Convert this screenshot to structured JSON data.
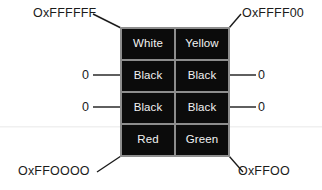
{
  "diagram": {
    "grid": {
      "columns": 2,
      "rows": 4,
      "cell_background": "#0b0b0b",
      "cell_text_color": "#f2f2f2",
      "divider_color": "#8d8d8d",
      "cells": [
        {
          "row": 1,
          "col": 1,
          "label": "White"
        },
        {
          "row": 1,
          "col": 2,
          "label": "Yellow"
        },
        {
          "row": 2,
          "col": 1,
          "label": "Black"
        },
        {
          "row": 2,
          "col": 2,
          "label": "Black"
        },
        {
          "row": 3,
          "col": 1,
          "label": "Black"
        },
        {
          "row": 3,
          "col": 2,
          "label": "Black"
        },
        {
          "row": 4,
          "col": 1,
          "label": "Red"
        },
        {
          "row": 4,
          "col": 2,
          "label": "Green"
        }
      ]
    },
    "callouts": {
      "top_left": "OxFFFFFF",
      "top_right": "OxFFFF00",
      "bottom_left": "OxFFOOOO",
      "bottom_right": "OxFFOO"
    },
    "zero_labels": {
      "left_upper": "0",
      "left_lower": "0",
      "right_upper": "0",
      "right_lower": "0"
    }
  }
}
